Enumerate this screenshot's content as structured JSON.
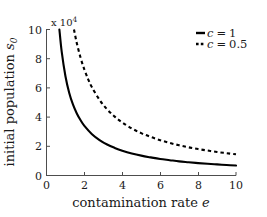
{
  "chart_data": {
    "type": "line",
    "title": "",
    "xlabel": "contamination rate e",
    "ylabel": "initial population s0",
    "y_multiplier_label": "x 10",
    "y_multiplier_exponent": "4",
    "y_multiplier_value": 10000,
    "xlim": [
      0,
      10
    ],
    "ylim": [
      0,
      10
    ],
    "xticks": [
      0,
      2,
      4,
      6,
      8,
      10
    ],
    "yticks": [
      0,
      2,
      4,
      6,
      8,
      10
    ],
    "xtick_labels": [
      "0",
      "2",
      "4",
      "6",
      "8",
      "10"
    ],
    "ytick_labels": [
      "0",
      "2",
      "4",
      "6",
      "8",
      "10"
    ],
    "grid": false,
    "legend_position": "upper right",
    "series": [
      {
        "name": "c = 1",
        "style": "solid",
        "color": "#000000",
        "x": [
          0.68,
          0.8,
          1.0,
          1.2,
          1.4,
          1.6,
          1.8,
          2.0,
          2.4,
          2.8,
          3.2,
          3.6,
          4.0,
          4.5,
          5.0,
          5.5,
          6.0,
          6.5,
          7.0,
          7.5,
          8.0,
          8.5,
          9.0,
          9.5,
          10.0
        ],
        "y": [
          10.0,
          8.5,
          6.8,
          5.65,
          4.85,
          4.25,
          3.78,
          3.4,
          2.83,
          2.43,
          2.12,
          1.89,
          1.7,
          1.51,
          1.36,
          1.24,
          1.13,
          1.05,
          0.97,
          0.91,
          0.85,
          0.8,
          0.76,
          0.72,
          0.68
        ]
      },
      {
        "name": "c = 0.5",
        "style": "dashed",
        "color": "#000000",
        "x": [
          1.45,
          1.6,
          1.8,
          2.0,
          2.2,
          2.4,
          2.8,
          3.2,
          3.6,
          4.0,
          4.5,
          5.0,
          5.5,
          6.0,
          6.5,
          7.0,
          7.5,
          8.0,
          8.5,
          9.0,
          9.5,
          10.0
        ],
        "y": [
          10.0,
          9.06,
          8.06,
          7.25,
          6.59,
          6.04,
          5.18,
          4.53,
          4.03,
          3.63,
          3.22,
          2.9,
          2.64,
          2.42,
          2.23,
          2.07,
          1.93,
          1.81,
          1.71,
          1.61,
          1.53,
          1.45
        ]
      }
    ],
    "legend_entries": [
      "c = 1",
      "c = 0.5"
    ]
  },
  "axes": {
    "x_title": "contamination rate e",
    "x_title_math_var": "e",
    "x_title_prefix": "contamination rate ",
    "y_title_prefix": "initial population ",
    "y_title_math_var": "s",
    "y_title_math_sub": "0",
    "multiplier_prefix": "x 10",
    "multiplier_exp": "4"
  },
  "legend": {
    "items": [
      {
        "label_prefix": "c",
        "label_eq": "=",
        "label_value": "1",
        "style": "solid"
      },
      {
        "label_prefix": "c",
        "label_eq": "=",
        "label_value": "0.5",
        "style": "dashed"
      }
    ]
  }
}
